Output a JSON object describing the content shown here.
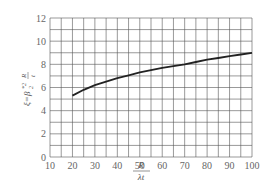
{
  "chart_data": {
    "type": "line",
    "title": "",
    "xlabel": "R/(λt)",
    "ylabel": "ξ = β₂*² R/t",
    "xlim": [
      10,
      100
    ],
    "ylim": [
      0,
      12
    ],
    "grid": true,
    "x_ticks": [
      10,
      20,
      30,
      40,
      50,
      60,
      70,
      80,
      90,
      100
    ],
    "y_ticks": [
      0,
      2,
      4,
      6,
      8,
      10,
      12
    ],
    "series": [
      {
        "name": "ξ",
        "x": [
          20,
          25,
          30,
          35,
          40,
          45,
          50,
          55,
          60,
          65,
          70,
          75,
          80,
          85,
          90,
          95,
          100
        ],
        "values": [
          5.3,
          5.8,
          6.2,
          6.5,
          6.8,
          7.05,
          7.3,
          7.5,
          7.7,
          7.85,
          8.0,
          8.2,
          8.4,
          8.55,
          8.7,
          8.85,
          9.0
        ]
      }
    ]
  },
  "labels": {
    "xlabel_num": "R",
    "xlabel_den": "λt",
    "ylabel_main": "ξ=β",
    "ylabel_sup": "*2",
    "ylabel_sub": "2",
    "ylabel_frac_num": "R",
    "ylabel_frac_den": "t"
  },
  "colors": {
    "grid": "#555555",
    "curve": "#222222",
    "text": "#666666"
  }
}
